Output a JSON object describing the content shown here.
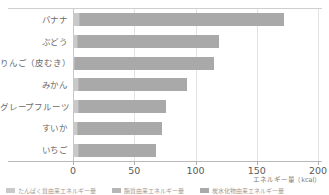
{
  "chart_data": {
    "type": "bar",
    "orientation": "horizontal",
    "stacked": true,
    "title": "",
    "xlabel": "エネルギー量（kcal）",
    "ylabel": "",
    "xlim": [
      0,
      200
    ],
    "ticks": [
      "0",
      "50",
      "100",
      "150",
      "200"
    ],
    "tick_values": [
      0,
      50,
      100,
      150,
      200
    ],
    "grid": "vertical",
    "legend_position": "bottom",
    "categories": [
      "バナナ",
      "ぶどう",
      "りんご（皮むき）",
      "みかん",
      "グレープフルーツ",
      "すいか",
      "いちご"
    ],
    "series": [
      {
        "name": "たんぱく質由来エネルギー量",
        "color": "#c9c9c9",
        "values": [
          5,
          3,
          1,
          4,
          4,
          3,
          4
        ]
      },
      {
        "name": "脂質由来エネルギー量",
        "color": "#b6b6b6",
        "values": [
          1,
          1,
          1,
          1,
          1,
          1,
          1
        ]
      },
      {
        "name": "炭水化物由来エネルギー量",
        "color": "#a9a9a9",
        "values": [
          166,
          115,
          113,
          88,
          71,
          69,
          63
        ]
      }
    ],
    "totals": [
      172,
      119,
      115,
      93,
      76,
      73,
      68
    ]
  },
  "legend": {
    "items": [
      {
        "label": "たんぱく質由来エネルギー量",
        "color": "#c9c9c9"
      },
      {
        "label": "脂質由来エネルギー量",
        "color": "#b6b6b6"
      },
      {
        "label": "炭水化物由来エネルギー量",
        "color": "#a9a9a9"
      }
    ]
  },
  "axis": {
    "x_title": "エネルギー量（kcal）"
  }
}
